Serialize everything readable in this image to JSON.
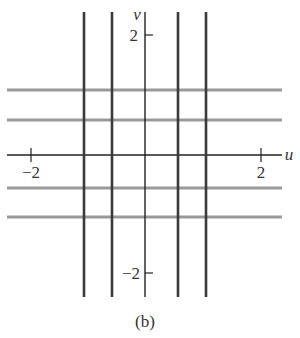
{
  "diagram": {
    "caption": "(b)",
    "axes": {
      "u_label": "u",
      "v_label": "v",
      "u_ticks": [
        {
          "value": -2,
          "label": "−2"
        },
        {
          "value": 2,
          "label": "2"
        }
      ],
      "v_ticks": [
        {
          "value": 2,
          "label": "2"
        },
        {
          "value": -2,
          "label": "−2"
        }
      ]
    },
    "vertical_lines_u": [
      -1.4,
      -0.8,
      0.7,
      1.3
    ],
    "horizontal_lines_v": [
      1.35,
      0.75,
      -0.75,
      -1.35
    ],
    "colors": {
      "vertical_lines": "#3a3a3a",
      "horizontal_lines": "#9a9a9a",
      "axes": "#222222"
    }
  }
}
